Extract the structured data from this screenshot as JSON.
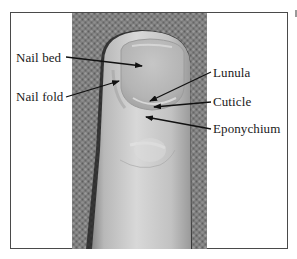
{
  "figure": {
    "type": "anatomical-photo-diagram",
    "labels": {
      "nail_bed": "Nail bed",
      "nail_fold": "Nail fold",
      "lunula": "Lunula",
      "cuticle": "Cuticle",
      "eponychium": "Eponychium"
    },
    "colors": {
      "frame": "#4a4a4a",
      "text": "#1a1a1a",
      "arrow": "#111111",
      "background_fabric": "#7a7a7a",
      "finger": "#c8c8c8"
    }
  }
}
